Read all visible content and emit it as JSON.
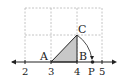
{
  "diagram": {
    "type": "number-line-construction",
    "grid": {
      "columns": 3,
      "rows": 2,
      "style": "dashed",
      "color": "#b0b0b0"
    },
    "number_line": {
      "ticks": [
        "2",
        "3",
        "4",
        "5"
      ],
      "point_label": "P"
    },
    "points": {
      "A": "A",
      "B": "B",
      "C": "C"
    },
    "triangle": {
      "fill": "#c8c8c8",
      "stroke": "#222222"
    },
    "arc": {
      "description": "arc from C to P centered at A"
    }
  }
}
